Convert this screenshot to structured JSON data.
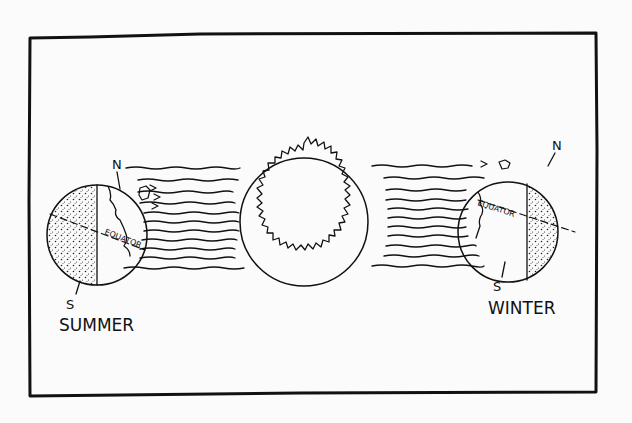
{
  "diagram": {
    "title": "",
    "sun": {
      "label": ""
    },
    "earth_left": {
      "season_label": "SUMMER",
      "north_label": "N",
      "south_label": "S",
      "equator_label": "EQUATOR"
    },
    "earth_right": {
      "season_label": "WINTER",
      "north_label": "N",
      "south_label": "S",
      "equator_label": "EQUATOR"
    },
    "colors": {
      "ink": "#111111",
      "paper": "#fbfbfb"
    }
  }
}
